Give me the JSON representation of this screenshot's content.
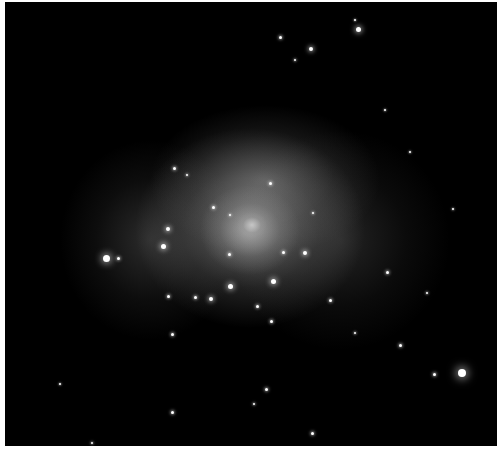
{
  "image": {
    "description": "Deep-field grayscale astronomical image of a galaxy cluster with diffuse bright glow around a central galaxy",
    "background_color": "#000000",
    "glow_color": "#b4b4b4",
    "core_color": "#ffffff"
  },
  "glows": [
    {
      "x": 250,
      "y": 228,
      "w": 230,
      "h": 200,
      "o": 0.55
    },
    {
      "x": 265,
      "y": 180,
      "w": 230,
      "h": 150,
      "o": 0.35
    },
    {
      "x": 150,
      "y": 240,
      "w": 180,
      "h": 200,
      "o": 0.22
    },
    {
      "x": 340,
      "y": 240,
      "w": 220,
      "h": 220,
      "o": 0.18
    },
    {
      "x": 250,
      "y": 230,
      "w": 100,
      "h": 90,
      "o": 0.6
    },
    {
      "x": 252,
      "y": 225,
      "w": 30,
      "h": 26,
      "o": 0.95
    }
  ],
  "stars": [
    {
      "x": 358,
      "y": 29,
      "r": 2.5
    },
    {
      "x": 355,
      "y": 20,
      "r": 1
    },
    {
      "x": 280,
      "y": 37,
      "r": 1.5
    },
    {
      "x": 311,
      "y": 49,
      "r": 2
    },
    {
      "x": 295,
      "y": 60,
      "r": 1.2
    },
    {
      "x": 106,
      "y": 258,
      "r": 3.5
    },
    {
      "x": 118,
      "y": 258,
      "r": 1.5
    },
    {
      "x": 462,
      "y": 373,
      "r": 4
    },
    {
      "x": 434,
      "y": 374,
      "r": 1.5
    },
    {
      "x": 230,
      "y": 286,
      "r": 2.5
    },
    {
      "x": 273,
      "y": 281,
      "r": 2.5
    },
    {
      "x": 211,
      "y": 299,
      "r": 2
    },
    {
      "x": 195,
      "y": 297,
      "r": 1.5
    },
    {
      "x": 168,
      "y": 296,
      "r": 1.5
    },
    {
      "x": 257,
      "y": 306,
      "r": 1.5
    },
    {
      "x": 271,
      "y": 321,
      "r": 1.5
    },
    {
      "x": 163,
      "y": 246,
      "r": 2.5
    },
    {
      "x": 168,
      "y": 229,
      "r": 2
    },
    {
      "x": 213,
      "y": 207,
      "r": 1.5
    },
    {
      "x": 229,
      "y": 254,
      "r": 1.5
    },
    {
      "x": 283,
      "y": 252,
      "r": 1.5
    },
    {
      "x": 305,
      "y": 253,
      "r": 2
    },
    {
      "x": 270,
      "y": 183,
      "r": 1.5
    },
    {
      "x": 230,
      "y": 215,
      "r": 1.2
    },
    {
      "x": 313,
      "y": 213,
      "r": 1.2
    },
    {
      "x": 174,
      "y": 168,
      "r": 1.5
    },
    {
      "x": 187,
      "y": 175,
      "r": 1.2
    },
    {
      "x": 387,
      "y": 272,
      "r": 1.5
    },
    {
      "x": 400,
      "y": 345,
      "r": 1.5
    },
    {
      "x": 330,
      "y": 300,
      "r": 1.5
    },
    {
      "x": 172,
      "y": 334,
      "r": 1.5
    },
    {
      "x": 266,
      "y": 389,
      "r": 1.5
    },
    {
      "x": 254,
      "y": 404,
      "r": 1.2
    },
    {
      "x": 312,
      "y": 433,
      "r": 1.5
    },
    {
      "x": 172,
      "y": 412,
      "r": 1.5
    },
    {
      "x": 92,
      "y": 443,
      "r": 1.2
    },
    {
      "x": 427,
      "y": 293,
      "r": 1.2
    },
    {
      "x": 410,
      "y": 152,
      "r": 1
    },
    {
      "x": 453,
      "y": 209,
      "r": 1
    },
    {
      "x": 385,
      "y": 110,
      "r": 1
    },
    {
      "x": 60,
      "y": 384,
      "r": 1
    },
    {
      "x": 355,
      "y": 333,
      "r": 1.2
    }
  ]
}
